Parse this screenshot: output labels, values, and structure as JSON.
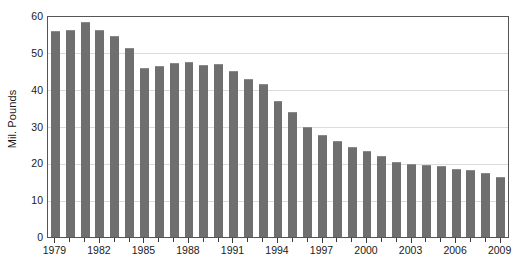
{
  "chart_data": {
    "type": "bar",
    "title": "",
    "subtitle": "",
    "xlabel": "",
    "ylabel": "Mil. Pounds",
    "ylim": [
      0,
      60
    ],
    "ytick_step": 10,
    "yticks": [
      0,
      10,
      20,
      30,
      40,
      50,
      60
    ],
    "ytick_labels": [
      "0",
      "10",
      "20",
      "30",
      "40",
      "50",
      "60"
    ],
    "xtick_labels": [
      "1979",
      "1982",
      "1985",
      "1988",
      "1991",
      "1994",
      "1997",
      "2000",
      "2003",
      "2006",
      "2009"
    ],
    "xtick_step_years": 3,
    "grid": true,
    "grid_axis": "y",
    "legend": false,
    "legend_position": "none",
    "bar_color": "#6f6f6f",
    "background_color": "#ffffff",
    "gridline_color": "#dcdcdc",
    "axis_color": "#555555",
    "categories": [
      "1979",
      "1980",
      "1981",
      "1982",
      "1983",
      "1984",
      "1985",
      "1986",
      "1987",
      "1988",
      "1989",
      "1990",
      "1991",
      "1992",
      "1993",
      "1994",
      "1995",
      "1996",
      "1997",
      "1998",
      "1999",
      "2000",
      "2001",
      "2002",
      "2003",
      "2004",
      "2005",
      "2006",
      "2007",
      "2008",
      "2009"
    ],
    "values": [
      55.8,
      56.2,
      58.5,
      56.3,
      54.6,
      51.3,
      45.8,
      46.4,
      47.3,
      47.5,
      46.8,
      46.9,
      45.0,
      43.0,
      41.5,
      37.0,
      34.0,
      30.0,
      27.8,
      26.0,
      24.5,
      23.3,
      22.0,
      20.5,
      19.8,
      19.6,
      19.3,
      18.6,
      18.2,
      17.5,
      16.3
    ],
    "series": [
      {
        "name": "Mil. Pounds",
        "values": [
          55.8,
          56.2,
          58.5,
          56.3,
          54.6,
          51.3,
          45.8,
          46.4,
          47.3,
          47.5,
          46.8,
          46.9,
          45.0,
          43.0,
          41.5,
          37.0,
          34.0,
          30.0,
          27.8,
          26.0,
          24.5,
          23.3,
          22.0,
          20.5,
          19.8,
          19.6,
          19.3,
          18.6,
          18.2,
          17.5,
          16.3
        ]
      }
    ]
  }
}
